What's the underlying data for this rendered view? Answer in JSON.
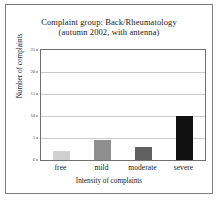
{
  "figure": {
    "title_line1": "Complaint group: Back/Rheumatology",
    "title_line2": "(autumn 2002, with antenna)",
    "frame_color": "#7d7d7d",
    "plot_border_color": "#6f6f6f",
    "grid_color": "#c9c9c9",
    "background": "#ffffff"
  },
  "chart_data": {
    "type": "bar",
    "title": "Complaint group: Back/Rheumatology (autumn 2002, with antenna)",
    "subtitle": "(autumn 2002, with antenna)",
    "xlabel": "Intensity of complaints",
    "ylabel": "Number of complaints",
    "categories": [
      "free",
      "mild",
      "moderate",
      "severe"
    ],
    "values": [
      2,
      4.5,
      3,
      10
    ],
    "bar_colors": [
      "#d0d0d0",
      "#8f8f8f",
      "#606060",
      "#111111"
    ],
    "ylim": [
      0,
      25
    ],
    "yticks": [
      0,
      5,
      10,
      15,
      20,
      25
    ],
    "ytick_labels": [
      "0",
      "5",
      "10",
      "15",
      "20",
      "25"
    ],
    "grid": "horizontal",
    "legend": "none"
  }
}
